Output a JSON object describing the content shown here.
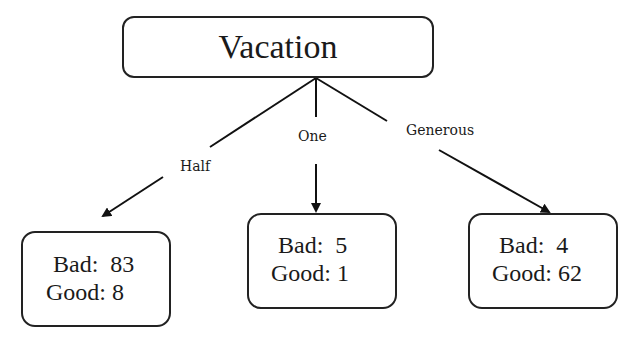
{
  "root": {
    "label": "Vacation"
  },
  "edges": [
    {
      "label": "Half"
    },
    {
      "label": "One"
    },
    {
      "label": "Generous"
    }
  ],
  "leaves": [
    {
      "bad_text": "Bad:  83",
      "good_text": "Good: 8",
      "bad": 83,
      "good": 8
    },
    {
      "bad_text": "Bad:  5",
      "good_text": "Good: 1",
      "bad": 5,
      "good": 1
    },
    {
      "bad_text": "Bad:  4",
      "good_text": "Good: 62",
      "bad": 4,
      "good": 62
    }
  ]
}
